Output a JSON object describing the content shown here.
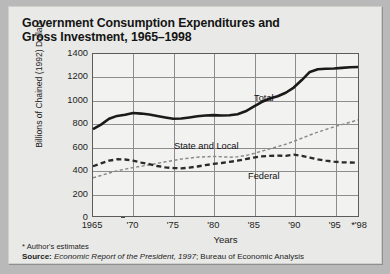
{
  "title": {
    "line1": "Government Consumption Expenditures and",
    "line2": "Gross Investment, 1965–1998"
  },
  "footnote": "* Author's estimates",
  "source": {
    "label": "Source:",
    "italic": " Economic Report of the President, 1997",
    "rest": "; Bureau of Economic Analysis"
  },
  "annotations": {
    "total": "Total",
    "state_and_local": "State and Local",
    "federal": "Federal"
  },
  "colors": {
    "panel_background": "#e9e9e7",
    "plot_background": "#f2f2f0",
    "outer_background": "#b9b9b9",
    "gridline": "#8d8d8d",
    "axis": "#5c5c5c",
    "total_line": "#1a1a1a",
    "federal_line": "#2a2a2a",
    "state_local_line": "#8a8a8a",
    "text": "#1d1d1d"
  },
  "chart_data": {
    "type": "line",
    "title": "Government Consumption Expenditures and Gross Investment, 1965–1998",
    "xlabel": "Years",
    "ylabel": "Billions of Chained (1992) Dollars",
    "xlim": [
      1965,
      1998
    ],
    "ylim": [
      0,
      1400
    ],
    "yticks": [
      0,
      200,
      400,
      600,
      800,
      1000,
      1200,
      1400
    ],
    "ytick_labels": [
      "0",
      "200",
      "400",
      "600",
      "800",
      "1000",
      "1200",
      "1400"
    ],
    "xticks": [
      1965,
      1970,
      1975,
      1980,
      1985,
      1990,
      1995,
      1998
    ],
    "xtick_labels": [
      "1965",
      "'70",
      "'75",
      "'80",
      "'85",
      "'90",
      "'95",
      "*'98"
    ],
    "grid": true,
    "legend": "inline-annotations",
    "x": [
      1965,
      1966,
      1967,
      1968,
      1969,
      1970,
      1971,
      1972,
      1973,
      1974,
      1975,
      1976,
      1977,
      1978,
      1979,
      1980,
      1981,
      1982,
      1983,
      1984,
      1985,
      1986,
      1987,
      1988,
      1989,
      1990,
      1991,
      1992,
      1993,
      1994,
      1995,
      1996,
      1997,
      1998
    ],
    "series": [
      {
        "name": "Total",
        "style": "solid",
        "values": [
          750,
          790,
          840,
          865,
          875,
          890,
          885,
          878,
          865,
          852,
          840,
          842,
          852,
          862,
          868,
          872,
          868,
          870,
          880,
          905,
          945,
          985,
          1015,
          1035,
          1065,
          1110,
          1175,
          1245,
          1268,
          1272,
          1275,
          1280,
          1285,
          1288
        ]
      },
      {
        "name": "State and Local",
        "style": "fine-dashed",
        "values": [
          330,
          350,
          372,
          390,
          405,
          418,
          430,
          442,
          455,
          468,
          480,
          492,
          500,
          508,
          512,
          515,
          512,
          508,
          512,
          522,
          540,
          560,
          580,
          600,
          620,
          645,
          672,
          700,
          725,
          748,
          770,
          790,
          810,
          830
        ]
      },
      {
        "name": "Federal",
        "style": "heavy-dashed",
        "values": [
          430,
          455,
          478,
          490,
          488,
          478,
          462,
          448,
          432,
          420,
          415,
          412,
          418,
          428,
          440,
          450,
          458,
          468,
          478,
          492,
          505,
          515,
          520,
          522,
          520,
          530,
          520,
          505,
          490,
          478,
          470,
          465,
          462,
          460
        ]
      }
    ]
  }
}
